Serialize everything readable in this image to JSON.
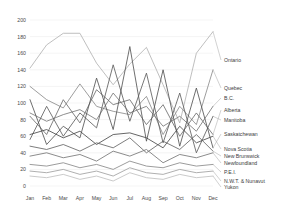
{
  "chart_data": {
    "type": "line",
    "title": "",
    "xlabel": "",
    "ylabel": "",
    "ylim": [
      0,
      200
    ],
    "ytick_step": 20,
    "grid": true,
    "legend_position": "right-inline-with-leaders",
    "categories": [
      "Jan",
      "Feb",
      "Mar",
      "Apr",
      "May",
      "Jun",
      "Jul",
      "Aug",
      "Sep",
      "Oct",
      "Nov",
      "Dec"
    ],
    "yticks": [
      "0",
      "20",
      "40",
      "60",
      "80",
      "100",
      "120",
      "140",
      "160",
      "180",
      "200"
    ],
    "series": [
      {
        "name": "Ontario",
        "color": "#b4b4b4",
        "values": [
          142,
          170,
          184,
          184,
          148,
          122,
          147,
          167,
          122,
          76,
          160,
          186
        ]
      },
      {
        "name": "Quebec",
        "color": "#8c8c8c",
        "values": [
          120,
          104,
          94,
          123,
          96,
          90,
          86,
          108,
          62,
          96,
          74,
          140
        ]
      },
      {
        "name": "B.C.",
        "color": "#7a7a7a",
        "values": [
          88,
          78,
          86,
          92,
          80,
          112,
          88,
          96,
          72,
          84,
          66,
          96
        ]
      },
      {
        "name": "Alberta",
        "color": "#6e6e6e",
        "values": [
          84,
          62,
          104,
          76,
          116,
          98,
          104,
          74,
          98,
          60,
          88,
          62
        ]
      },
      {
        "name": "Manitoba",
        "color": "#606060",
        "values": [
          56,
          96,
          60,
          88,
          70,
          146,
          78,
          136,
          52,
          112,
          40,
          84
        ]
      },
      {
        "name": "Saskatchewan",
        "color": "#555555",
        "values": [
          104,
          50,
          72,
          58,
          130,
          68,
          168,
          54,
          140,
          48,
          118,
          46
        ]
      },
      {
        "name": "Nova Scotia",
        "color": "#4a4a4a",
        "values": [
          62,
          68,
          58,
          66,
          50,
          62,
          64,
          58,
          46,
          72,
          52,
          60
        ]
      },
      {
        "name": "New Brunswick",
        "color": "#666666",
        "values": [
          48,
          44,
          50,
          42,
          52,
          46,
          58,
          40,
          54,
          44,
          62,
          42
        ]
      },
      {
        "name": "Newfoundland",
        "color": "#777777",
        "values": [
          36,
          40,
          34,
          38,
          30,
          42,
          36,
          44,
          28,
          38,
          34,
          40
        ]
      },
      {
        "name": "P.E.I.",
        "color": "#8a8a8a",
        "values": [
          26,
          24,
          28,
          22,
          26,
          20,
          30,
          24,
          22,
          28,
          24,
          26
        ]
      },
      {
        "name": "N.W.T. & Nunavut",
        "color": "#a0a0a0",
        "values": [
          18,
          16,
          20,
          14,
          18,
          12,
          22,
          16,
          14,
          20,
          16,
          18
        ]
      },
      {
        "name": "Yukon",
        "color": "#c0c0c0",
        "values": [
          12,
          10,
          14,
          8,
          12,
          6,
          16,
          10,
          8,
          14,
          10,
          12
        ]
      }
    ]
  },
  "legend": {
    "items": [
      {
        "label": "Ontario"
      },
      {
        "label": "Quebec"
      },
      {
        "label": "B.C."
      },
      {
        "label": "Alberta"
      },
      {
        "label": "Manitoba"
      },
      {
        "label": "Saskatchewan"
      },
      {
        "label": "Nova Scotia"
      },
      {
        "label": "New Brunswick"
      },
      {
        "label": "Newfoundland"
      },
      {
        "label": "P.E.I."
      },
      {
        "label": "N.W.T. & Nunavut"
      },
      {
        "label": "Yukon"
      }
    ]
  }
}
